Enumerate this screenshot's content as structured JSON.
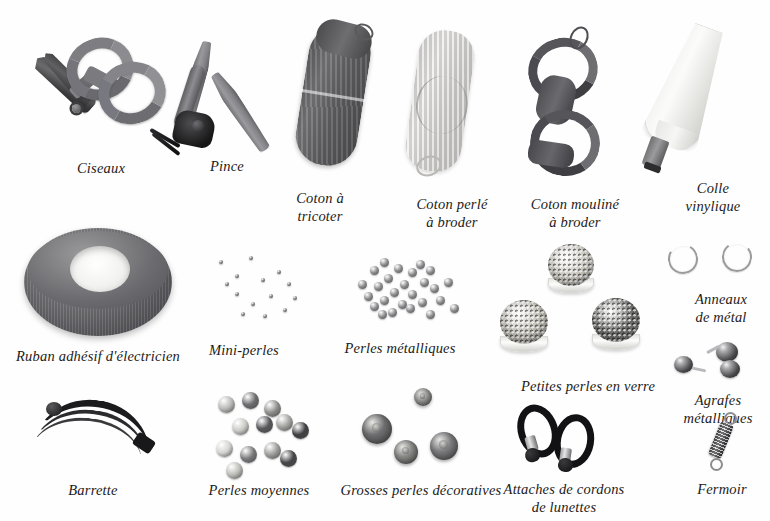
{
  "plate": {
    "title": "Matériel de loisirs créatifs",
    "language": "fr",
    "background_color": "#ffffff",
    "text_color": "#1c1a18"
  },
  "rows": [
    {
      "row": 1,
      "items": [
        {
          "label": "Ciseaux",
          "icon": "scissors-icon",
          "x": 101,
          "y": 160
        },
        {
          "label": "Pince",
          "icon": "pliers-icon",
          "x": 227,
          "y": 158
        },
        {
          "label": "Coton à\ntricoter",
          "icon": "knitting-yarn-icon",
          "x": 320,
          "y": 190
        },
        {
          "label": "Coton perlé\nà broder",
          "icon": "pearl-cotton-icon",
          "x": 452,
          "y": 196
        },
        {
          "label": "Coton mouliné\nà broder",
          "icon": "stranded-cotton-icon",
          "x": 575,
          "y": 196
        },
        {
          "label": "Colle\nvinylique",
          "icon": "glue-bottle-icon",
          "x": 713,
          "y": 180
        }
      ]
    },
    {
      "row": 2,
      "items": [
        {
          "label": "Ruban adhésif d'électricien",
          "icon": "tape-roll-icon",
          "x": 98,
          "y": 348
        },
        {
          "label": "Mini-perles",
          "icon": "mini-beads-icon",
          "x": 244,
          "y": 342
        },
        {
          "label": "Perles métalliques",
          "icon": "metal-beads-icon",
          "x": 400,
          "y": 340
        },
        {
          "label": "Petites perles en verre",
          "icon": "glass-beads-jars-icon",
          "x": 588,
          "y": 378
        },
        {
          "label": "Anneaux\nde métal",
          "icon": "split-rings-icon",
          "x": 721,
          "y": 291
        },
        {
          "label": "Agrafes\nmétalliques",
          "icon": "crimp-beads-icon",
          "x": 718,
          "y": 392
        }
      ]
    },
    {
      "row": 3,
      "items": [
        {
          "label": "Barrette",
          "icon": "hair-barrette-icon",
          "x": 93,
          "y": 482
        },
        {
          "label": "Perles moyennes",
          "icon": "medium-beads-icon",
          "x": 259,
          "y": 482
        },
        {
          "label": "Grosses perles décoratives",
          "icon": "large-beads-icon",
          "x": 421,
          "y": 482
        },
        {
          "label": "Attaches de cordons\nde lunettes",
          "icon": "eyeglass-cord-icon",
          "x": 564,
          "y": 481
        },
        {
          "label": "Fermoir",
          "icon": "barrel-clasp-icon",
          "x": 722,
          "y": 481
        }
      ]
    }
  ],
  "labels": {
    "ciseaux": "Ciseaux",
    "pince": "Pince",
    "coton_tricoter": "Coton à\ntricoter",
    "coton_perle": "Coton perlé\nà broder",
    "coton_mouline": "Coton mouliné\nà broder",
    "colle": "Colle\nvinylique",
    "ruban": "Ruban adhésif d'électricien",
    "mini_perles": "Mini-perles",
    "perles_metalliques": "Perles métalliques",
    "petites_perles": "Petites perles en verre",
    "anneaux": "Anneaux\nde métal",
    "agrafes": "Agrafes\nmétalliques",
    "barrette": "Barrette",
    "perles_moyennes": "Perles moyennes",
    "grosses_perles": "Grosses perles décoratives",
    "attaches": "Attaches de cordons\nde lunettes",
    "fermoir": "Fermoir"
  },
  "bead_groups": {
    "mini_perles": {
      "count": 14,
      "size_px": 4,
      "color": "#7e7e80",
      "positions": [
        [
          14,
          8
        ],
        [
          30,
          22
        ],
        [
          44,
          4
        ],
        [
          56,
          26
        ],
        [
          30,
          40
        ],
        [
          64,
          42
        ],
        [
          46,
          50
        ],
        [
          72,
          18
        ],
        [
          82,
          30
        ],
        [
          20,
          30
        ],
        [
          78,
          56
        ],
        [
          58,
          62
        ],
        [
          36,
          60
        ],
        [
          88,
          44
        ]
      ]
    },
    "perles_metalliques": {
      "count": 26,
      "size_px": 9,
      "color": "#8d8d90",
      "positions": [
        [
          8,
          28
        ],
        [
          20,
          14
        ],
        [
          30,
          6
        ],
        [
          34,
          22
        ],
        [
          44,
          12
        ],
        [
          24,
          30
        ],
        [
          14,
          40
        ],
        [
          30,
          44
        ],
        [
          40,
          36
        ],
        [
          50,
          28
        ],
        [
          58,
          16
        ],
        [
          66,
          8
        ],
        [
          76,
          14
        ],
        [
          70,
          26
        ],
        [
          80,
          32
        ],
        [
          58,
          38
        ],
        [
          48,
          48
        ],
        [
          38,
          56
        ],
        [
          28,
          58
        ],
        [
          56,
          52
        ],
        [
          68,
          46
        ],
        [
          86,
          44
        ],
        [
          94,
          26
        ],
        [
          100,
          52
        ],
        [
          20,
          50
        ],
        [
          76,
          58
        ]
      ]
    },
    "perles_moyennes": {
      "count": 12,
      "size_px": 17,
      "colors": [
        "#b9b9b7",
        "#6d6d6f",
        "#8d8d8b",
        "#c9c9c5",
        "#57575a",
        "#a3a3a0",
        "#3f3f42",
        "#d4d4d0",
        "#7a7a7c",
        "#9c9c99",
        "#464649",
        "#bcbcb8"
      ],
      "positions": [
        [
          6,
          4
        ],
        [
          30,
          0
        ],
        [
          52,
          8
        ],
        [
          20,
          26
        ],
        [
          44,
          24
        ],
        [
          64,
          22
        ],
        [
          80,
          30
        ],
        [
          4,
          48
        ],
        [
          28,
          54
        ],
        [
          52,
          50
        ],
        [
          68,
          58
        ],
        [
          14,
          70
        ]
      ]
    },
    "grosses_perles": {
      "count": 4,
      "sizes_px": [
        30,
        24,
        28,
        18
      ],
      "colors": [
        "#6f6f71",
        "#8a8a87",
        "#7d7d80",
        "#9a9a97"
      ],
      "positions": [
        [
          4,
          26
        ],
        [
          36,
          52
        ],
        [
          72,
          44
        ],
        [
          56,
          0
        ]
      ]
    },
    "jars": [
      {
        "name": "jar-light-top",
        "x": 548,
        "y": 244,
        "d": 44,
        "fill": "#c9c6bd"
      },
      {
        "name": "jar-light-left",
        "x": 500,
        "y": 300,
        "d": 46,
        "fill": "#bdbab1"
      },
      {
        "name": "jar-dark-right",
        "x": 592,
        "y": 298,
        "d": 46,
        "fill": "#6a6a68"
      }
    ]
  },
  "colors": {
    "ink": "#1c1a18",
    "metal_light": "#b9b9bc",
    "metal_dark": "#2a2a2c",
    "yarn_dark": "#5c5c5e",
    "yarn_light": "#d3d3d2",
    "tape_gray": "#76767a",
    "paper": "#ffffff"
  }
}
